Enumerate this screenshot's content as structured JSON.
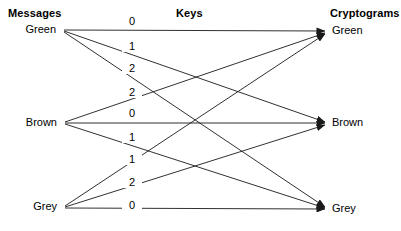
{
  "columns": {
    "left_header": "Messages",
    "middle_header": "Keys",
    "right_header": "Cryptograms"
  },
  "messages": [
    {
      "label": "Green",
      "x": 61,
      "y": 30
    },
    {
      "label": "Brown",
      "x": 62,
      "y": 123
    },
    {
      "label": "Grey",
      "x": 62,
      "y": 207
    }
  ],
  "cryptograms": [
    {
      "label": "Green",
      "x": 327,
      "y": 31
    },
    {
      "label": "Brown",
      "x": 327,
      "y": 123
    },
    {
      "label": "Grey",
      "x": 327,
      "y": 209
    }
  ],
  "edges": [
    {
      "from": "Green",
      "to": "Green",
      "key": "0",
      "x1": 64,
      "y1": 30,
      "x2": 325,
      "y2": 31,
      "lx": 130,
      "ly": 22
    },
    {
      "from": "Green",
      "to": "Brown",
      "key": "1",
      "x1": 64,
      "y1": 31,
      "x2": 325,
      "y2": 122,
      "lx": 130,
      "ly": 47
    },
    {
      "from": "Green",
      "to": "Grey",
      "key": "2",
      "x1": 64,
      "y1": 32,
      "x2": 325,
      "y2": 207,
      "lx": 130,
      "ly": 69
    },
    {
      "from": "Brown",
      "to": "Green",
      "key": "2",
      "x1": 65,
      "y1": 122,
      "x2": 325,
      "y2": 33,
      "lx": 130,
      "ly": 93
    },
    {
      "from": "Brown",
      "to": "Brown",
      "key": "0",
      "x1": 65,
      "y1": 123,
      "x2": 325,
      "y2": 123,
      "lx": 130,
      "ly": 114
    },
    {
      "from": "Brown",
      "to": "Grey",
      "key": "1",
      "x1": 65,
      "y1": 124,
      "x2": 325,
      "y2": 208,
      "lx": 130,
      "ly": 138
    },
    {
      "from": "Grey",
      "to": "Green",
      "key": "1",
      "x1": 65,
      "y1": 206,
      "x2": 325,
      "y2": 34,
      "lx": 130,
      "ly": 160
    },
    {
      "from": "Grey",
      "to": "Brown",
      "key": "2",
      "x1": 65,
      "y1": 207,
      "x2": 325,
      "y2": 125,
      "lx": 130,
      "ly": 183
    },
    {
      "from": "Grey",
      "to": "Grey",
      "key": "0",
      "x1": 65,
      "y1": 208,
      "x2": 325,
      "y2": 209,
      "lx": 130,
      "ly": 206
    }
  ],
  "headers_pos": {
    "left_x": 8,
    "left_y": 7,
    "middle_x": 176,
    "middle_y": 7,
    "right_x": 330,
    "right_y": 7
  },
  "style": {
    "line_color": "#1a1a1a",
    "text_color": "#000000",
    "background": "#ffffff"
  }
}
